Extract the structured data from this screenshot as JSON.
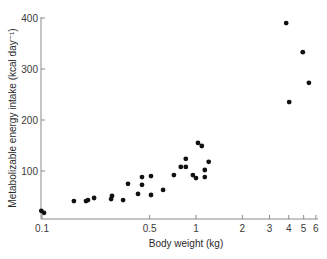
{
  "chart_data": {
    "type": "scatter",
    "title": "",
    "xlabel": "Body weight (kg)",
    "ylabel": "Metabolizable energy intake (kcal day⁻¹)",
    "xscale": "log",
    "yscale": "linear",
    "xlim": [
      0.1,
      6
    ],
    "ylim": [
      5,
      400
    ],
    "x_ticks": [
      0.1,
      0.5,
      1,
      2,
      3,
      4,
      5,
      6
    ],
    "x_tick_labels": [
      "0.1",
      "0.5",
      "1",
      "2",
      "3",
      "4",
      "5",
      "6"
    ],
    "y_ticks": [
      100,
      200,
      300,
      400
    ],
    "y_tick_labels": [
      "100",
      "200",
      "300",
      "400"
    ],
    "grid": false,
    "legend": null,
    "marker_color": "#111111",
    "series": [
      {
        "name": "observations",
        "points": [
          {
            "x": 0.099,
            "y": 22
          },
          {
            "x": 0.103,
            "y": 18
          },
          {
            "x": 0.161,
            "y": 41
          },
          {
            "x": 0.193,
            "y": 41
          },
          {
            "x": 0.199,
            "y": 43
          },
          {
            "x": 0.218,
            "y": 47
          },
          {
            "x": 0.281,
            "y": 45
          },
          {
            "x": 0.285,
            "y": 51
          },
          {
            "x": 0.336,
            "y": 43
          },
          {
            "x": 0.362,
            "y": 75
          },
          {
            "x": 0.42,
            "y": 55
          },
          {
            "x": 0.446,
            "y": 88
          },
          {
            "x": 0.446,
            "y": 73
          },
          {
            "x": 0.51,
            "y": 90
          },
          {
            "x": 0.51,
            "y": 53
          },
          {
            "x": 0.611,
            "y": 63
          },
          {
            "x": 0.719,
            "y": 92
          },
          {
            "x": 0.797,
            "y": 108
          },
          {
            "x": 0.859,
            "y": 108
          },
          {
            "x": 0.859,
            "y": 124
          },
          {
            "x": 0.954,
            "y": 92
          },
          {
            "x": 1.0,
            "y": 86
          },
          {
            "x": 1.03,
            "y": 155
          },
          {
            "x": 1.09,
            "y": 149
          },
          {
            "x": 1.14,
            "y": 102
          },
          {
            "x": 1.14,
            "y": 88
          },
          {
            "x": 1.21,
            "y": 118
          },
          {
            "x": 3.85,
            "y": 390
          },
          {
            "x": 4.03,
            "y": 235
          },
          {
            "x": 4.94,
            "y": 333
          },
          {
            "x": 5.41,
            "y": 273
          }
        ]
      }
    ]
  },
  "layout": {
    "plot_left": 41,
    "plot_right": 318,
    "plot_top": 17,
    "plot_bottom": 219,
    "x_px_at_0_1": 42,
    "x_px_per_decade": 154,
    "y_px_at_zero": 222,
    "y_px_per_unit": 0.51
  }
}
